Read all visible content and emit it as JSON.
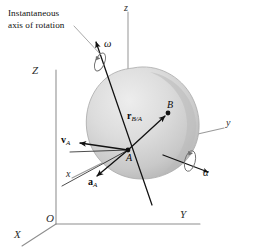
{
  "figure": {
    "background_color": "#ffffff",
    "width": 256,
    "height": 252
  },
  "annotations": {
    "callout_line1": "Instantaneous",
    "callout_line2": "axis of rotation"
  },
  "fixed_frame": {
    "origin_label": "O",
    "x_label": "X",
    "y_label": "Y",
    "z_label": "Z",
    "color": "#8e8e8e"
  },
  "moving_frame": {
    "x_label": "x",
    "y_label": "y",
    "z_label": "z",
    "color": "#9a9a9a"
  },
  "points": {
    "a_label": "A",
    "b_label": "B"
  },
  "vectors": [
    {
      "name": "angular-velocity",
      "symbol": "ω",
      "style": "greek-italic",
      "color": "#111111"
    },
    {
      "name": "angular-acceleration",
      "symbol": "α",
      "style": "greek-italic",
      "color": "#111111"
    },
    {
      "name": "relative-position",
      "base": "r",
      "sub": "B/A",
      "color": "#111111"
    },
    {
      "name": "velocity-of-a",
      "base": "v",
      "sub": "A",
      "color": "#111111"
    },
    {
      "name": "acceleration-of-a",
      "base": "a",
      "sub": "A",
      "color": "#111111"
    }
  ],
  "body": {
    "name": "rigid-body",
    "fill_light": "#e3e3e3",
    "fill_mid": "#cfcfcf",
    "fill_dark": "#b6b6b6",
    "edge_color": "#a8a8a8"
  },
  "colors": {
    "ink": "#111111",
    "axis_gray": "#8e8e8e",
    "leader_gray": "#9e9e9e",
    "paper": "#ffffff"
  }
}
